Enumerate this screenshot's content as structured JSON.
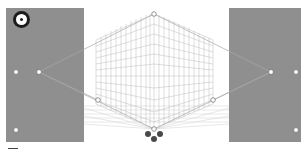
{
  "tool": {
    "name": "Perspective Grid",
    "widget_icon": "plane-switching-widget-icon"
  },
  "colors": {
    "panel": "#8f8f8f",
    "grid_line": "#b5b5b5",
    "horizon_line": "#9a9a9a",
    "handle": "#ffffff",
    "plane_dots": "#4a4a4a",
    "background": "#ffffff"
  },
  "grid": {
    "left_vanishing_point": [
      39,
      72
    ],
    "right_vanishing_point": [
      271,
      72
    ],
    "top_handle": [
      154,
      14
    ],
    "bottom_origin": [
      154,
      129
    ],
    "left_plane_handle": [
      98,
      100
    ],
    "right_plane_handle": [
      213,
      100
    ]
  },
  "panels": {
    "left": {
      "handles": [
        [
          16,
          72
        ],
        [
          39,
          72
        ],
        [
          16,
          130
        ]
      ]
    },
    "right": {
      "handles": [
        [
          271,
          72
        ],
        [
          296,
          72
        ],
        [
          296,
          130
        ]
      ]
    }
  },
  "bottom_widget": {
    "dots": [
      [
        148,
        134
      ],
      [
        154,
        139
      ],
      [
        160,
        134
      ]
    ]
  }
}
